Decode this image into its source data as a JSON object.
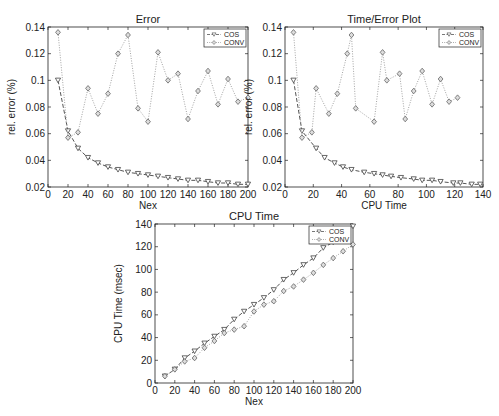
{
  "chart_data": [
    {
      "type": "line",
      "title": "Error",
      "xlabel": "Nex",
      "ylabel": "rel. error (%)",
      "xlim": [
        0,
        200
      ],
      "ylim": [
        0.02,
        0.14
      ],
      "xticks": [
        0,
        20,
        40,
        60,
        80,
        100,
        120,
        140,
        160,
        180,
        200
      ],
      "yticks": [
        0.02,
        0.04,
        0.06,
        0.08,
        0.1,
        0.12,
        0.14
      ],
      "ytick_labels": [
        "0.02",
        "0.04",
        "0.06",
        "0.08",
        "0.1",
        "0.12",
        "0.14"
      ],
      "grid": false,
      "legend_position": "upper right",
      "x": [
        10,
        20,
        30,
        40,
        50,
        60,
        70,
        80,
        90,
        100,
        110,
        120,
        130,
        140,
        150,
        160,
        170,
        180,
        190,
        200
      ],
      "series": [
        {
          "name": "COS",
          "marker": "triangle-down",
          "linestyle": "dashed",
          "values": [
            0.1,
            0.062,
            0.049,
            0.042,
            0.038,
            0.035,
            0.033,
            0.031,
            0.03,
            0.029,
            0.028,
            0.027,
            0.026,
            0.025,
            0.025,
            0.024,
            0.023,
            0.023,
            0.022,
            0.022
          ]
        },
        {
          "name": "CONV",
          "marker": "diamond",
          "linestyle": "dotted",
          "values": [
            0.136,
            0.057,
            0.061,
            0.094,
            0.075,
            0.09,
            0.12,
            0.134,
            0.079,
            0.069,
            0.121,
            0.1,
            0.105,
            0.071,
            0.092,
            0.107,
            0.082,
            0.101,
            0.084,
            0.087
          ]
        }
      ]
    },
    {
      "type": "line",
      "title": "Time/Error Plot",
      "xlabel": "CPU Time",
      "ylabel": "rel. error (%)",
      "xlim": [
        0,
        140
      ],
      "ylim": [
        0.02,
        0.14
      ],
      "xticks": [
        0,
        20,
        40,
        60,
        80,
        100,
        120,
        140
      ],
      "yticks": [
        0.02,
        0.04,
        0.06,
        0.08,
        0.1,
        0.12,
        0.14
      ],
      "ytick_labels": [
        "0.02",
        "0.04",
        "0.06",
        "0.08",
        "0.1",
        "0.12",
        "0.14"
      ],
      "grid": false,
      "legend_position": "upper right",
      "series": [
        {
          "name": "COS",
          "marker": "triangle-down",
          "linestyle": "dashed",
          "x": [
            6,
            12,
            22,
            28,
            35,
            41,
            47,
            56,
            63,
            69,
            75,
            82,
            91,
            97,
            104,
            110,
            119,
            124,
            132,
            138
          ],
          "values": [
            0.1,
            0.062,
            0.049,
            0.042,
            0.038,
            0.035,
            0.033,
            0.031,
            0.03,
            0.029,
            0.028,
            0.027,
            0.026,
            0.025,
            0.025,
            0.024,
            0.023,
            0.023,
            0.022,
            0.022
          ]
        },
        {
          "name": "CONV",
          "marker": "diamond",
          "linestyle": "dotted",
          "x": [
            6,
            12,
            19,
            22,
            31,
            37,
            44,
            47,
            50,
            63,
            69,
            72,
            81,
            85,
            91,
            97,
            104,
            110,
            116,
            122
          ],
          "values": [
            0.136,
            0.057,
            0.061,
            0.094,
            0.075,
            0.09,
            0.12,
            0.134,
            0.079,
            0.069,
            0.121,
            0.1,
            0.105,
            0.071,
            0.092,
            0.107,
            0.082,
            0.101,
            0.084,
            0.087
          ]
        }
      ]
    },
    {
      "type": "line",
      "title": "CPU Time",
      "xlabel": "Nex",
      "ylabel": "CPU Time (msec)",
      "xlim": [
        0,
        200
      ],
      "ylim": [
        0,
        140
      ],
      "xticks": [
        0,
        20,
        40,
        60,
        80,
        100,
        120,
        140,
        160,
        180,
        200
      ],
      "yticks": [
        0,
        20,
        40,
        60,
        80,
        100,
        120,
        140
      ],
      "ytick_labels": [
        "0",
        "20",
        "40",
        "60",
        "80",
        "100",
        "120",
        "140"
      ],
      "grid": false,
      "legend_position": "upper right",
      "x": [
        10,
        20,
        30,
        40,
        50,
        60,
        70,
        80,
        90,
        100,
        110,
        120,
        130,
        140,
        150,
        160,
        170,
        180,
        190,
        200
      ],
      "series": [
        {
          "name": "COS",
          "marker": "triangle-down",
          "linestyle": "dashed",
          "values": [
            6,
            12,
            22,
            28,
            35,
            41,
            47,
            56,
            63,
            69,
            75,
            82,
            91,
            97,
            104,
            110,
            119,
            124,
            132,
            138
          ]
        },
        {
          "name": "CONV",
          "marker": "diamond",
          "linestyle": "dotted",
          "values": [
            6,
            12,
            19,
            22,
            31,
            37,
            44,
            47,
            50,
            63,
            69,
            72,
            81,
            85,
            91,
            97,
            104,
            110,
            116,
            122
          ]
        }
      ]
    }
  ],
  "layout": [
    {
      "left": 48,
      "right": 248,
      "top": 27,
      "bottom": 187
    },
    {
      "left": 285,
      "right": 483,
      "top": 27,
      "bottom": 187
    },
    {
      "left": 155,
      "right": 353,
      "top": 224,
      "bottom": 383
    }
  ],
  "colors": {
    "cos": "#555555",
    "conv": "#999999",
    "axis": "#222222"
  }
}
